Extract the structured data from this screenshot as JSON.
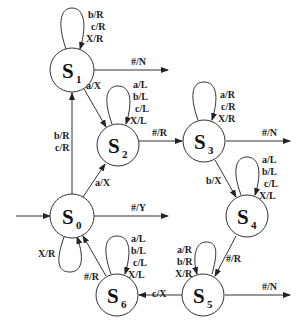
{
  "diagram": {
    "type": "state-transition",
    "states": [
      {
        "id": "S0",
        "letter": "S",
        "sub": "0",
        "x": 72,
        "y": 216,
        "initial": true
      },
      {
        "id": "S1",
        "letter": "S",
        "sub": "1",
        "x": 72,
        "y": 70
      },
      {
        "id": "S2",
        "letter": "S",
        "sub": "2",
        "x": 118,
        "y": 145
      },
      {
        "id": "S3",
        "letter": "S",
        "sub": "3",
        "x": 204,
        "y": 141
      },
      {
        "id": "S4",
        "letter": "S",
        "sub": "4",
        "x": 247,
        "y": 216
      },
      {
        "id": "S5",
        "letter": "S",
        "sub": "5",
        "x": 203,
        "y": 295
      },
      {
        "id": "S6",
        "letter": "S",
        "sub": "6",
        "x": 117,
        "y": 295
      }
    ],
    "labels": {
      "s1_loop": [
        "b/R",
        "c/R",
        "X/R"
      ],
      "s1_exit": "#/N",
      "s1_to_s2": "a/X",
      "s0_to_s1": [
        "b/R",
        "c/R"
      ],
      "s2_loop": [
        "a/L",
        "b/L",
        "c/L",
        "X/L"
      ],
      "s2_to_s3": "#/R",
      "s0_to_s2": "a/X",
      "s3_loop": [
        "a/R",
        "c/R",
        "X/R"
      ],
      "s3_exit": "#/N",
      "s3_to_s4": "b/X",
      "s4_loop": [
        "a/L",
        "b/L",
        "c/L",
        "X/L"
      ],
      "s0_exit": "#/Y",
      "s0_loop": "X/R",
      "s6_loop": [
        "a/L",
        "b/L",
        "c/L",
        "X/L"
      ],
      "s6_to_s0": "#/R",
      "s4_to_s5": "#/R",
      "s5_loop": [
        "a/R",
        "b/R",
        "X/R"
      ],
      "s5_to_s6": "c/X",
      "s5_exit": "#/N"
    }
  }
}
